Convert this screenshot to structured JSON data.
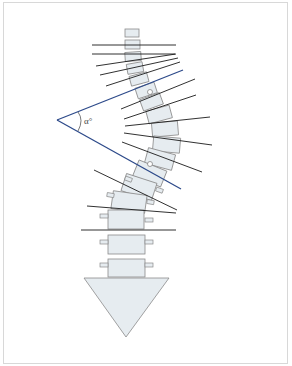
{
  "diagram": {
    "angle_label": "α°",
    "colors": {
      "vertebra_fill": "#e6ecf0",
      "vertebra_stroke": "#888888",
      "angle_line": "#2d4a8a",
      "endplate_line": "#111111",
      "frame": "#d8d8d8"
    },
    "elements": [
      "stacked vertebrae along a curved spine",
      "endplate lines extending from each vertebra",
      "two blue Cobb lines converging to the left forming angle α°",
      "pelvis/sacrum depicted as a downward triangle"
    ]
  }
}
